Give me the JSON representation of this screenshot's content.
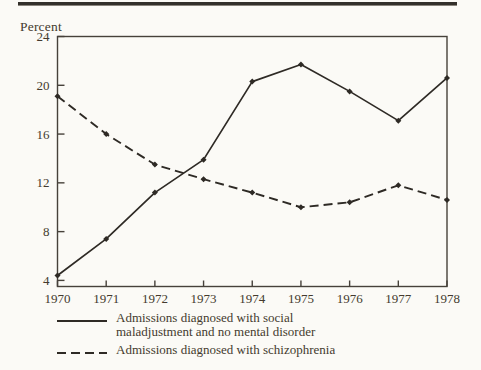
{
  "figure": {
    "y_axis_title": "Percent"
  },
  "chart_data": {
    "type": "line",
    "title": "",
    "y_axis_title": "Percent",
    "x": [
      1970,
      1971,
      1972,
      1973,
      1974,
      1975,
      1976,
      1977,
      1978
    ],
    "series": [
      {
        "name": "Admissions diagnosed with social maladjustment and no mental disorder",
        "style": "solid",
        "values": [
          4.4,
          7.4,
          11.2,
          13.9,
          20.3,
          21.7,
          19.5,
          17.1,
          20.6
        ]
      },
      {
        "name": "Admissions diagnosed with schizophrenia",
        "style": "dashed",
        "values": [
          19.1,
          16.0,
          13.5,
          12.3,
          11.2,
          10.0,
          10.4,
          11.8,
          10.6
        ]
      }
    ],
    "y_ticks": [
      4,
      8,
      12,
      16,
      20,
      24
    ],
    "ylim": [
      3.5,
      24
    ],
    "grid": false,
    "legend_position": "bottom",
    "markers": "filled-diamond"
  },
  "legend": {
    "items": [
      {
        "line1": "Admissions diagnosed with social",
        "line2": "maladjustment and no mental disorder",
        "style": "solid"
      },
      {
        "line1": "Admissions diagnosed with schizophrenia",
        "line2": "",
        "style": "dashed"
      }
    ]
  },
  "colors": {
    "ink": "#2e2a25",
    "axis": "#46413a",
    "text": "#443a2e",
    "paper": "#fbfaf6",
    "rule": "#33302b"
  }
}
